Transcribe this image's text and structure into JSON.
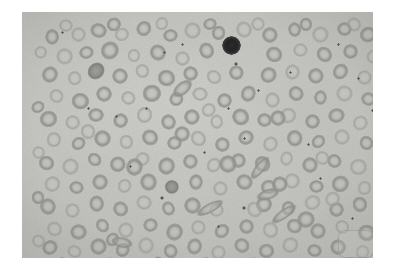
{
  "figure": {
    "kind": "photomicrograph",
    "staining": "grayscale halftone print",
    "border_color": "#ffffff",
    "background_color": "#c9c9c5",
    "photo_rect": {
      "x": 22,
      "y": 12,
      "width": 351,
      "height": 246
    },
    "alt_text": "Grayscale photomicrograph of a peripheral blood film showing numerous red blood cells with central pallor, several elongated sickle-shaped cells, scattered dark platelets, and one darkly stained nucleated white blood cell."
  },
  "palette": {
    "background": "#c9c9c5",
    "rbc_rim": "#8f8f8b",
    "rbc_center": "#c4c4c0",
    "dense_cell": "#8c8c88",
    "wbc_nucleus": "#242424",
    "platelet": "#4b4b49",
    "print_border": "#ffffff"
  },
  "features": {
    "white_blood_cell": {
      "label": "darkly stained nucleated cell",
      "x": 209,
      "y": 33,
      "diameter": 19
    },
    "artifact": {
      "label": "faint rounded rectangle print artifact",
      "x": 316,
      "y": 218,
      "width": 34,
      "height": 26
    },
    "counts": {
      "red_blood_cells": 186,
      "sickle_cells": 6,
      "platelets": 22,
      "white_blood_cells": 1
    }
  },
  "red_blood_cells": [
    {
      "x": 30,
      "y": 26,
      "d": 16,
      "t": "normo"
    },
    {
      "x": 56,
      "y": 22,
      "d": 15,
      "t": "pale"
    },
    {
      "x": 76,
      "y": 19,
      "d": 17,
      "t": "normo"
    },
    {
      "x": 100,
      "y": 22,
      "d": 14,
      "t": "pale"
    },
    {
      "x": 122,
      "y": 17,
      "d": 16,
      "t": "normo"
    },
    {
      "x": 148,
      "y": 24,
      "d": 15,
      "t": "normo"
    },
    {
      "x": 170,
      "y": 18,
      "d": 17,
      "t": "pale"
    },
    {
      "x": 196,
      "y": 21,
      "d": 15,
      "t": "normo"
    },
    {
      "x": 222,
      "y": 17,
      "d": 16,
      "t": "pale"
    },
    {
      "x": 248,
      "y": 23,
      "d": 16,
      "t": "normo"
    },
    {
      "x": 272,
      "y": 18,
      "d": 15,
      "t": "normo"
    },
    {
      "x": 298,
      "y": 22,
      "d": 17,
      "t": "pale"
    },
    {
      "x": 322,
      "y": 17,
      "d": 15,
      "t": "normo"
    },
    {
      "x": 346,
      "y": 22,
      "d": 16,
      "t": "normo"
    },
    {
      "x": 42,
      "y": 44,
      "d": 17,
      "t": "pale"
    },
    {
      "x": 64,
      "y": 41,
      "d": 15,
      "t": "normo"
    },
    {
      "x": 88,
      "y": 38,
      "d": 18,
      "t": "normo"
    },
    {
      "x": 112,
      "y": 44,
      "d": 14,
      "t": "pale"
    },
    {
      "x": 136,
      "y": 40,
      "d": 16,
      "t": "normo"
    },
    {
      "x": 160,
      "y": 46,
      "d": 15,
      "t": "pale"
    },
    {
      "x": 184,
      "y": 39,
      "d": 17,
      "t": "normo"
    },
    {
      "x": 252,
      "y": 42,
      "d": 16,
      "t": "normo"
    },
    {
      "x": 278,
      "y": 38,
      "d": 15,
      "t": "pale"
    },
    {
      "x": 302,
      "y": 43,
      "d": 17,
      "t": "normo"
    },
    {
      "x": 328,
      "y": 39,
      "d": 15,
      "t": "normo"
    },
    {
      "x": 352,
      "y": 45,
      "d": 16,
      "t": "pale"
    },
    {
      "x": 28,
      "y": 62,
      "d": 16,
      "t": "normo"
    },
    {
      "x": 52,
      "y": 66,
      "d": 15,
      "t": "pale"
    },
    {
      "x": 74,
      "y": 60,
      "d": 18,
      "t": "dense"
    },
    {
      "x": 98,
      "y": 64,
      "d": 16,
      "t": "normo"
    },
    {
      "x": 120,
      "y": 59,
      "d": 15,
      "t": "pale"
    },
    {
      "x": 144,
      "y": 65,
      "d": 17,
      "t": "normo"
    },
    {
      "x": 168,
      "y": 61,
      "d": 15,
      "t": "normo"
    },
    {
      "x": 192,
      "y": 66,
      "d": 16,
      "t": "pale"
    },
    {
      "x": 214,
      "y": 60,
      "d": 15,
      "t": "normo"
    },
    {
      "x": 246,
      "y": 63,
      "d": 17,
      "t": "normo"
    },
    {
      "x": 270,
      "y": 59,
      "d": 15,
      "t": "pale"
    },
    {
      "x": 294,
      "y": 64,
      "d": 16,
      "t": "normo"
    },
    {
      "x": 318,
      "y": 60,
      "d": 17,
      "t": "normo"
    },
    {
      "x": 342,
      "y": 65,
      "d": 15,
      "t": "pale"
    },
    {
      "x": 34,
      "y": 84,
      "d": 15,
      "t": "pale"
    },
    {
      "x": 58,
      "y": 88,
      "d": 17,
      "t": "normo"
    },
    {
      "x": 82,
      "y": 82,
      "d": 16,
      "t": "normo"
    },
    {
      "x": 106,
      "y": 86,
      "d": 15,
      "t": "pale"
    },
    {
      "x": 130,
      "y": 81,
      "d": 18,
      "t": "normo"
    },
    {
      "x": 154,
      "y": 87,
      "d": 15,
      "t": "normo"
    },
    {
      "x": 178,
      "y": 83,
      "d": 16,
      "t": "pale"
    },
    {
      "x": 202,
      "y": 88,
      "d": 15,
      "t": "normo"
    },
    {
      "x": 226,
      "y": 82,
      "d": 17,
      "t": "normo"
    },
    {
      "x": 250,
      "y": 87,
      "d": 15,
      "t": "pale"
    },
    {
      "x": 274,
      "y": 82,
      "d": 16,
      "t": "normo"
    },
    {
      "x": 298,
      "y": 86,
      "d": 15,
      "t": "normo"
    },
    {
      "x": 322,
      "y": 81,
      "d": 17,
      "t": "pale"
    },
    {
      "x": 346,
      "y": 87,
      "d": 15,
      "t": "normo"
    },
    {
      "x": 26,
      "y": 106,
      "d": 17,
      "t": "normo"
    },
    {
      "x": 50,
      "y": 110,
      "d": 15,
      "t": "pale"
    },
    {
      "x": 74,
      "y": 104,
      "d": 16,
      "t": "normo"
    },
    {
      "x": 98,
      "y": 108,
      "d": 15,
      "t": "normo"
    },
    {
      "x": 122,
      "y": 103,
      "d": 17,
      "t": "pale"
    },
    {
      "x": 146,
      "y": 109,
      "d": 15,
      "t": "normo"
    },
    {
      "x": 170,
      "y": 105,
      "d": 16,
      "t": "normo"
    },
    {
      "x": 194,
      "y": 110,
      "d": 15,
      "t": "pale"
    },
    {
      "x": 218,
      "y": 104,
      "d": 17,
      "t": "normo"
    },
    {
      "x": 242,
      "y": 108,
      "d": 15,
      "t": "normo"
    },
    {
      "x": 266,
      "y": 103,
      "d": 16,
      "t": "pale"
    },
    {
      "x": 290,
      "y": 109,
      "d": 15,
      "t": "normo"
    },
    {
      "x": 314,
      "y": 104,
      "d": 17,
      "t": "normo"
    },
    {
      "x": 338,
      "y": 110,
      "d": 15,
      "t": "pale"
    },
    {
      "x": 32,
      "y": 128,
      "d": 16,
      "t": "pale"
    },
    {
      "x": 56,
      "y": 132,
      "d": 15,
      "t": "normo"
    },
    {
      "x": 80,
      "y": 126,
      "d": 17,
      "t": "normo"
    },
    {
      "x": 104,
      "y": 130,
      "d": 15,
      "t": "pale"
    },
    {
      "x": 128,
      "y": 125,
      "d": 16,
      "t": "normo"
    },
    {
      "x": 152,
      "y": 131,
      "d": 15,
      "t": "normo"
    },
    {
      "x": 176,
      "y": 127,
      "d": 17,
      "t": "pale"
    },
    {
      "x": 200,
      "y": 132,
      "d": 15,
      "t": "normo"
    },
    {
      "x": 224,
      "y": 126,
      "d": 16,
      "t": "normo"
    },
    {
      "x": 248,
      "y": 131,
      "d": 15,
      "t": "pale"
    },
    {
      "x": 272,
      "y": 126,
      "d": 17,
      "t": "normo"
    },
    {
      "x": 296,
      "y": 130,
      "d": 15,
      "t": "normo"
    },
    {
      "x": 320,
      "y": 125,
      "d": 16,
      "t": "pale"
    },
    {
      "x": 344,
      "y": 131,
      "d": 15,
      "t": "normo"
    },
    {
      "x": 24,
      "y": 150,
      "d": 15,
      "t": "normo"
    },
    {
      "x": 48,
      "y": 154,
      "d": 17,
      "t": "pale"
    },
    {
      "x": 72,
      "y": 148,
      "d": 15,
      "t": "normo"
    },
    {
      "x": 96,
      "y": 152,
      "d": 16,
      "t": "normo"
    },
    {
      "x": 120,
      "y": 147,
      "d": 15,
      "t": "pale"
    },
    {
      "x": 144,
      "y": 153,
      "d": 17,
      "t": "normo"
    },
    {
      "x": 168,
      "y": 149,
      "d": 15,
      "t": "normo"
    },
    {
      "x": 192,
      "y": 154,
      "d": 16,
      "t": "pale"
    },
    {
      "x": 216,
      "y": 148,
      "d": 15,
      "t": "normo"
    },
    {
      "x": 240,
      "y": 152,
      "d": 17,
      "t": "normo"
    },
    {
      "x": 264,
      "y": 147,
      "d": 15,
      "t": "pale"
    },
    {
      "x": 288,
      "y": 153,
      "d": 16,
      "t": "normo"
    },
    {
      "x": 312,
      "y": 149,
      "d": 15,
      "t": "normo"
    },
    {
      "x": 336,
      "y": 154,
      "d": 17,
      "t": "pale"
    },
    {
      "x": 30,
      "y": 172,
      "d": 17,
      "t": "pale"
    },
    {
      "x": 54,
      "y": 176,
      "d": 15,
      "t": "normo"
    },
    {
      "x": 78,
      "y": 170,
      "d": 16,
      "t": "normo"
    },
    {
      "x": 102,
      "y": 174,
      "d": 15,
      "t": "pale"
    },
    {
      "x": 126,
      "y": 169,
      "d": 17,
      "t": "normo"
    },
    {
      "x": 150,
      "y": 175,
      "d": 14,
      "t": "dense"
    },
    {
      "x": 174,
      "y": 171,
      "d": 16,
      "t": "normo"
    },
    {
      "x": 198,
      "y": 176,
      "d": 15,
      "t": "pale"
    },
    {
      "x": 222,
      "y": 170,
      "d": 17,
      "t": "normo"
    },
    {
      "x": 246,
      "y": 174,
      "d": 15,
      "t": "normo"
    },
    {
      "x": 270,
      "y": 169,
      "d": 16,
      "t": "pale"
    },
    {
      "x": 294,
      "y": 175,
      "d": 15,
      "t": "normo"
    },
    {
      "x": 318,
      "y": 171,
      "d": 17,
      "t": "normo"
    },
    {
      "x": 342,
      "y": 176,
      "d": 15,
      "t": "pale"
    },
    {
      "x": 26,
      "y": 194,
      "d": 16,
      "t": "normo"
    },
    {
      "x": 50,
      "y": 198,
      "d": 15,
      "t": "pale"
    },
    {
      "x": 74,
      "y": 192,
      "d": 17,
      "t": "normo"
    },
    {
      "x": 98,
      "y": 196,
      "d": 15,
      "t": "normo"
    },
    {
      "x": 122,
      "y": 191,
      "d": 16,
      "t": "pale"
    },
    {
      "x": 146,
      "y": 197,
      "d": 15,
      "t": "normo"
    },
    {
      "x": 170,
      "y": 193,
      "d": 17,
      "t": "normo"
    },
    {
      "x": 194,
      "y": 198,
      "d": 15,
      "t": "pale"
    },
    {
      "x": 242,
      "y": 192,
      "d": 16,
      "t": "normo"
    },
    {
      "x": 266,
      "y": 196,
      "d": 15,
      "t": "normo"
    },
    {
      "x": 290,
      "y": 191,
      "d": 17,
      "t": "pale"
    },
    {
      "x": 314,
      "y": 197,
      "d": 15,
      "t": "normo"
    },
    {
      "x": 338,
      "y": 193,
      "d": 16,
      "t": "normo"
    },
    {
      "x": 32,
      "y": 216,
      "d": 15,
      "t": "pale"
    },
    {
      "x": 56,
      "y": 220,
      "d": 17,
      "t": "normo"
    },
    {
      "x": 80,
      "y": 214,
      "d": 15,
      "t": "normo"
    },
    {
      "x": 104,
      "y": 218,
      "d": 16,
      "t": "pale"
    },
    {
      "x": 128,
      "y": 213,
      "d": 15,
      "t": "normo"
    },
    {
      "x": 152,
      "y": 219,
      "d": 17,
      "t": "normo"
    },
    {
      "x": 176,
      "y": 215,
      "d": 15,
      "t": "pale"
    },
    {
      "x": 200,
      "y": 220,
      "d": 16,
      "t": "normo"
    },
    {
      "x": 224,
      "y": 214,
      "d": 15,
      "t": "normo"
    },
    {
      "x": 248,
      "y": 218,
      "d": 17,
      "t": "pale"
    },
    {
      "x": 272,
      "y": 213,
      "d": 15,
      "t": "normo"
    },
    {
      "x": 296,
      "y": 219,
      "d": 16,
      "t": "normo"
    },
    {
      "x": 320,
      "y": 215,
      "d": 15,
      "t": "pale"
    },
    {
      "x": 344,
      "y": 220,
      "d": 17,
      "t": "normo"
    },
    {
      "x": 28,
      "y": 236,
      "d": 16,
      "t": "normo"
    },
    {
      "x": 52,
      "y": 240,
      "d": 15,
      "t": "pale"
    },
    {
      "x": 76,
      "y": 234,
      "d": 17,
      "t": "normo"
    },
    {
      "x": 100,
      "y": 238,
      "d": 15,
      "t": "normo"
    },
    {
      "x": 124,
      "y": 233,
      "d": 16,
      "t": "pale"
    },
    {
      "x": 148,
      "y": 239,
      "d": 15,
      "t": "normo"
    },
    {
      "x": 172,
      "y": 235,
      "d": 17,
      "t": "normo"
    },
    {
      "x": 196,
      "y": 240,
      "d": 15,
      "t": "pale"
    },
    {
      "x": 220,
      "y": 234,
      "d": 16,
      "t": "normo"
    },
    {
      "x": 244,
      "y": 238,
      "d": 15,
      "t": "normo"
    },
    {
      "x": 268,
      "y": 233,
      "d": 17,
      "t": "pale"
    },
    {
      "x": 292,
      "y": 239,
      "d": 15,
      "t": "normo"
    },
    {
      "x": 316,
      "y": 235,
      "d": 16,
      "t": "normo"
    },
    {
      "x": 340,
      "y": 240,
      "d": 15,
      "t": "pale"
    },
    {
      "x": 40,
      "y": 252,
      "d": 14,
      "t": "normo"
    },
    {
      "x": 88,
      "y": 252,
      "d": 15,
      "t": "pale"
    },
    {
      "x": 136,
      "y": 252,
      "d": 14,
      "t": "normo"
    },
    {
      "x": 184,
      "y": 252,
      "d": 15,
      "t": "normo"
    },
    {
      "x": 232,
      "y": 252,
      "d": 14,
      "t": "pale"
    },
    {
      "x": 280,
      "y": 252,
      "d": 15,
      "t": "normo"
    },
    {
      "x": 328,
      "y": 252,
      "d": 14,
      "t": "normo"
    },
    {
      "x": 44,
      "y": 14,
      "d": 14,
      "t": "pale"
    },
    {
      "x": 92,
      "y": 12,
      "d": 14,
      "t": "normo"
    },
    {
      "x": 140,
      "y": 12,
      "d": 14,
      "t": "pale"
    },
    {
      "x": 188,
      "y": 13,
      "d": 14,
      "t": "normo"
    },
    {
      "x": 236,
      "y": 12,
      "d": 14,
      "t": "pale"
    },
    {
      "x": 284,
      "y": 13,
      "d": 14,
      "t": "normo"
    },
    {
      "x": 332,
      "y": 12,
      "d": 14,
      "t": "pale"
    },
    {
      "x": 364,
      "y": 32,
      "d": 14,
      "t": "normo"
    },
    {
      "x": 364,
      "y": 76,
      "d": 14,
      "t": "pale"
    },
    {
      "x": 364,
      "y": 120,
      "d": 14,
      "t": "normo"
    },
    {
      "x": 364,
      "y": 164,
      "d": 14,
      "t": "pale"
    },
    {
      "x": 364,
      "y": 208,
      "d": 14,
      "t": "normo"
    },
    {
      "x": 18,
      "y": 40,
      "d": 13,
      "t": "pale"
    },
    {
      "x": 16,
      "y": 96,
      "d": 14,
      "t": "normo"
    },
    {
      "x": 16,
      "y": 140,
      "d": 13,
      "t": "pale"
    },
    {
      "x": 16,
      "y": 186,
      "d": 14,
      "t": "normo"
    },
    {
      "x": 16,
      "y": 228,
      "d": 13,
      "t": "pale"
    },
    {
      "x": 206,
      "y": 152,
      "d": 18,
      "t": "normo"
    },
    {
      "x": 232,
      "y": 198,
      "d": 17,
      "t": "pale"
    },
    {
      "x": 258,
      "y": 172,
      "d": 16,
      "t": "normo"
    },
    {
      "x": 284,
      "y": 208,
      "d": 18,
      "t": "normo"
    },
    {
      "x": 310,
      "y": 186,
      "d": 15,
      "t": "pale"
    },
    {
      "x": 160,
      "y": 122,
      "d": 16,
      "t": "normo"
    },
    {
      "x": 186,
      "y": 98,
      "d": 15,
      "t": "pale"
    },
    {
      "x": 112,
      "y": 154,
      "d": 17,
      "t": "normo"
    },
    {
      "x": 66,
      "y": 120,
      "d": 16,
      "t": "pale"
    },
    {
      "x": 90,
      "y": 228,
      "d": 15,
      "t": "normo"
    },
    {
      "x": 256,
      "y": 106,
      "d": 16,
      "t": "normo"
    },
    {
      "x": 300,
      "y": 146,
      "d": 15,
      "t": "pale"
    }
  ],
  "sickle_cells": [
    {
      "x": 188,
      "y": 196,
      "w": 30,
      "h": 10,
      "rot": -28
    },
    {
      "x": 238,
      "y": 156,
      "w": 28,
      "h": 10,
      "rot": -52
    },
    {
      "x": 262,
      "y": 202,
      "w": 30,
      "h": 10,
      "rot": -36
    },
    {
      "x": 246,
      "y": 182,
      "w": 24,
      "h": 11,
      "rot": -18
    },
    {
      "x": 160,
      "y": 76,
      "w": 23,
      "h": 13,
      "rot": -40
    },
    {
      "x": 100,
      "y": 230,
      "w": 22,
      "h": 11,
      "rot": 12
    }
  ],
  "platelets": [
    {
      "x": 40,
      "y": 20,
      "d": 3
    },
    {
      "x": 142,
      "y": 40,
      "d": 3
    },
    {
      "x": 160,
      "y": 32,
      "d": 3
    },
    {
      "x": 214,
      "y": 52,
      "d": 4
    },
    {
      "x": 236,
      "y": 78,
      "d": 3
    },
    {
      "x": 94,
      "y": 104,
      "d": 3
    },
    {
      "x": 66,
      "y": 96,
      "d": 3
    },
    {
      "x": 124,
      "y": 96,
      "d": 3
    },
    {
      "x": 206,
      "y": 96,
      "d": 3
    },
    {
      "x": 268,
      "y": 60,
      "d": 3
    },
    {
      "x": 316,
      "y": 32,
      "d": 3
    },
    {
      "x": 336,
      "y": 66,
      "d": 3
    },
    {
      "x": 350,
      "y": 98,
      "d": 3
    },
    {
      "x": 182,
      "y": 140,
      "d": 3
    },
    {
      "x": 222,
      "y": 126,
      "d": 3
    },
    {
      "x": 286,
      "y": 132,
      "d": 3
    },
    {
      "x": 140,
      "y": 186,
      "d": 4
    },
    {
      "x": 222,
      "y": 196,
      "d": 4
    },
    {
      "x": 196,
      "y": 214,
      "d": 3
    },
    {
      "x": 108,
      "y": 154,
      "d": 3
    },
    {
      "x": 298,
      "y": 166,
      "d": 3
    },
    {
      "x": 330,
      "y": 206,
      "d": 3
    }
  ]
}
